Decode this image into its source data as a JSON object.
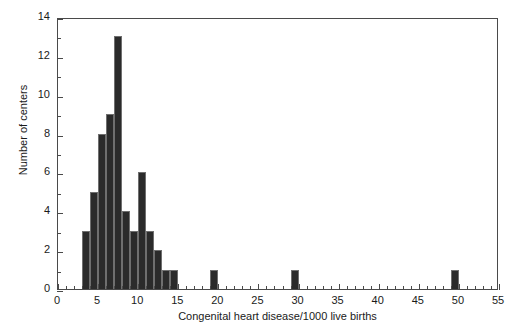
{
  "chart_data": {
    "type": "bar",
    "title": "",
    "subtitle": "",
    "xlabel": "Congenital heart disease/1000 live births",
    "ylabel": "Number of centers",
    "xlim": [
      0,
      55
    ],
    "ylim": [
      0,
      14
    ],
    "x_major_step": 5,
    "x_minor_step": 1,
    "y_major_step": 2,
    "y_minor_step": 1,
    "grid": false,
    "legend": null,
    "bin_width": 1,
    "bar_color": "#2b2b2b",
    "axis_color": "#4a4a4a",
    "x_ticks": [
      0,
      5,
      10,
      15,
      20,
      25,
      30,
      35,
      40,
      45,
      50,
      55
    ],
    "y_ticks": [
      0,
      2,
      4,
      6,
      8,
      10,
      12,
      14
    ],
    "bins": [
      {
        "start": 3,
        "end": 4,
        "count": 3
      },
      {
        "start": 4,
        "end": 5,
        "count": 5
      },
      {
        "start": 5,
        "end": 6,
        "count": 8
      },
      {
        "start": 6,
        "end": 7,
        "count": 9
      },
      {
        "start": 7,
        "end": 8,
        "count": 13
      },
      {
        "start": 8,
        "end": 9,
        "count": 4
      },
      {
        "start": 9,
        "end": 10,
        "count": 3
      },
      {
        "start": 10,
        "end": 11,
        "count": 6
      },
      {
        "start": 11,
        "end": 12,
        "count": 3
      },
      {
        "start": 12,
        "end": 13,
        "count": 2
      },
      {
        "start": 13,
        "end": 14,
        "count": 1
      },
      {
        "start": 14,
        "end": 15,
        "count": 1
      },
      {
        "start": 19,
        "end": 20,
        "count": 1
      },
      {
        "start": 29,
        "end": 30,
        "count": 1
      },
      {
        "start": 49,
        "end": 50,
        "count": 1
      }
    ],
    "categories": [
      "3-4",
      "4-5",
      "5-6",
      "6-7",
      "7-8",
      "8-9",
      "9-10",
      "10-11",
      "11-12",
      "12-13",
      "13-14",
      "14-15",
      "19-20",
      "29-30",
      "49-50"
    ],
    "values": [
      3,
      5,
      8,
      9,
      13,
      4,
      3,
      6,
      3,
      2,
      1,
      1,
      1,
      1,
      1
    ]
  }
}
